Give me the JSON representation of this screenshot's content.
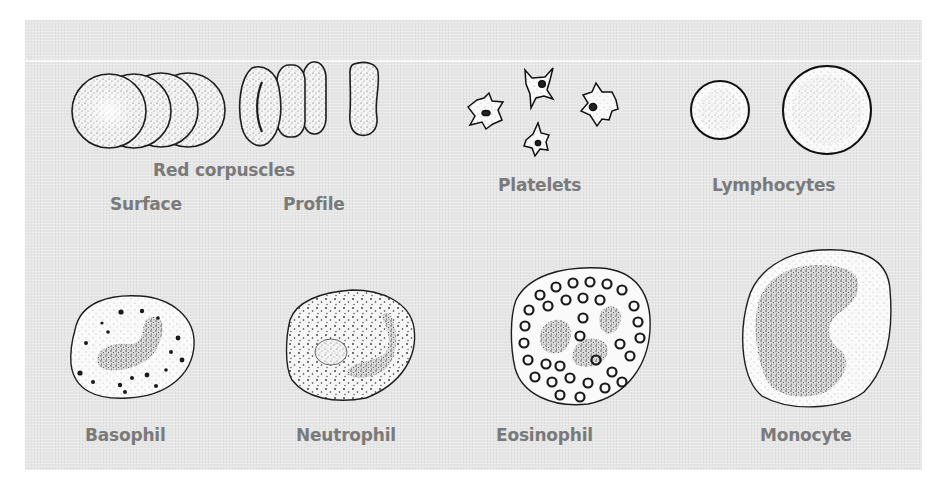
{
  "figure": {
    "sections": {
      "red_corpuscles": {
        "title": "Red corpuscles",
        "views": [
          "Surface",
          "Profile"
        ]
      },
      "platelets": {
        "title": "Platelets"
      },
      "lymphocytes": {
        "title": "Lymphocytes"
      },
      "basophil": {
        "title": "Basophil"
      },
      "neutrophil": {
        "title": "Neutrophil"
      },
      "eosinophil": {
        "title": "Eosinophil"
      },
      "monocyte": {
        "title": "Monocyte"
      }
    },
    "colors": {
      "panel_background": "#e6e6e6",
      "label_text": "#7a7a7a",
      "outline": "#222222",
      "cell_fill": "#f7f7f7"
    }
  }
}
